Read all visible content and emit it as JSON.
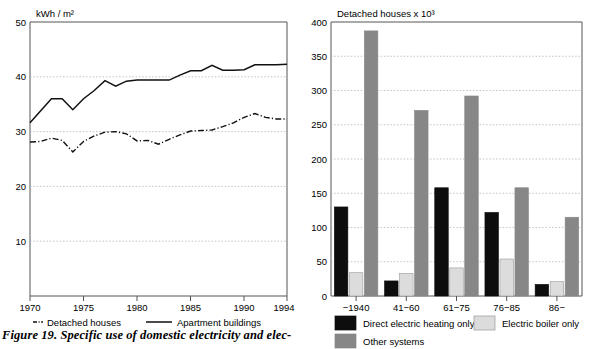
{
  "caption": {
    "text": "Figure 19.  Specific use of domestic electricity and elec-"
  },
  "chart_data": [
    {
      "id": "line-chart",
      "type": "line",
      "title": "",
      "ylabel": "kWh / m²",
      "xlabel": "",
      "ylim": [
        0,
        50
      ],
      "yticks": [
        10,
        20,
        30,
        40,
        50
      ],
      "xlim": [
        1970,
        1994
      ],
      "xticks": [
        1970,
        1975,
        1980,
        1985,
        1990,
        1994
      ],
      "xticklabels": [
        "1970",
        "1975",
        "1980",
        "1985",
        "1990",
        "1994"
      ],
      "grid": true,
      "legend_position": "below",
      "x": [
        1970,
        1971,
        1972,
        1973,
        1974,
        1975,
        1976,
        1977,
        1978,
        1979,
        1980,
        1981,
        1982,
        1983,
        1984,
        1985,
        1986,
        1987,
        1988,
        1989,
        1990,
        1991,
        1992,
        1993,
        1994
      ],
      "series": [
        {
          "name": "Detached houses",
          "style": "dash-dot",
          "color": "#111111",
          "values": [
            28.1,
            28.2,
            28.8,
            28.4,
            26.3,
            28.2,
            29.2,
            29.9,
            30.0,
            29.6,
            28.3,
            28.4,
            27.7,
            28.6,
            29.4,
            30.1,
            30.2,
            30.3,
            30.9,
            31.6,
            32.6,
            33.3,
            32.6,
            32.3,
            32.3
          ]
        },
        {
          "name": "Apartment buildings",
          "style": "solid",
          "color": "#111111",
          "values": [
            31.6,
            33.8,
            36.0,
            36.0,
            34.0,
            36.0,
            37.5,
            39.3,
            38.3,
            39.2,
            39.4,
            39.4,
            39.4,
            39.4,
            40.3,
            41.1,
            41.1,
            42.1,
            41.2,
            41.2,
            41.3,
            42.2,
            42.2,
            42.2,
            42.3
          ]
        }
      ]
    },
    {
      "id": "bar-chart",
      "type": "bar",
      "title": "Detached houses x 10³",
      "ylabel": "",
      "xlabel": "",
      "ylim": [
        0,
        400
      ],
      "yticks": [
        0,
        50,
        100,
        150,
        200,
        250,
        300,
        350,
        400
      ],
      "grid": true,
      "legend_position": "below",
      "categories": [
        "−1940",
        "41−60",
        "61−75",
        "76−85",
        "86−"
      ],
      "series": [
        {
          "name": "Direct electric heating only",
          "color": "#0d0d0d",
          "values": [
            130,
            22,
            158,
            122,
            17
          ]
        },
        {
          "name": "Electric boiler only",
          "color": "#dcdcdc",
          "values": [
            34,
            33,
            41,
            54,
            21
          ]
        },
        {
          "name": "Other systems",
          "color": "#878787",
          "values": [
            387,
            271,
            292,
            158,
            115
          ]
        }
      ]
    }
  ]
}
